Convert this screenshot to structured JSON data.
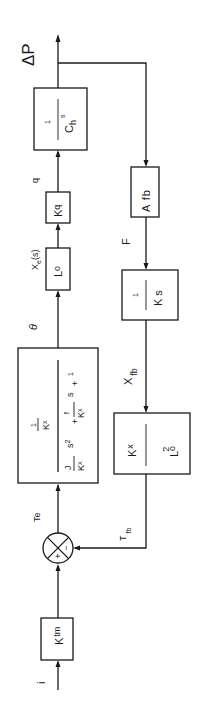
{
  "diagram": {
    "type": "block-diagram",
    "orientation": "rotated-90-ccw",
    "colors": {
      "line": "#1a1a1a",
      "background": "#ffffff"
    },
    "signals": {
      "input": "i",
      "error_torque": "Te",
      "angle": "θ",
      "displacement": "Xe(s)",
      "displacement_base": "X",
      "displacement_sub": "e",
      "displacement_arg": "(s)",
      "flow": "q",
      "output": "ΔP",
      "force": "F",
      "feedback_disp": "X",
      "feedback_disp_sub": "fb",
      "feedback_torque": "T",
      "feedback_torque_sub": "fb"
    },
    "blocks": {
      "ktm": {
        "base": "K",
        "sub": "tm"
      },
      "torque_motor": {
        "num_top": "1",
        "num_bottom": "K",
        "num_bottom_sub": "x",
        "den_J": "J",
        "den_Kx1": "K",
        "den_Kx1_sub": "x",
        "den_s2": "s",
        "den_s2_sup": "2",
        "den_plus1": "+",
        "den_f": "f",
        "den_Kx2": "K",
        "den_Kx2_sub": "x",
        "den_s": "s",
        "den_plus2": "+",
        "den_one": "1"
      },
      "lo": {
        "base": "L",
        "sub": "o"
      },
      "kq": {
        "base": "K",
        "sub": "q"
      },
      "ch": {
        "num": "1",
        "den": "C",
        "den_sub": "h",
        "den_s": "s"
      },
      "afb": {
        "label": "A fb"
      },
      "ks": {
        "num": "1",
        "den": "K",
        "den_s": "s"
      },
      "kx_lo2": {
        "num": "K",
        "num_sub": "x",
        "den": "L",
        "den_sub": "o",
        "den_sup": "2"
      }
    },
    "summing_junction": {
      "plus": "+",
      "minus": "−"
    }
  }
}
